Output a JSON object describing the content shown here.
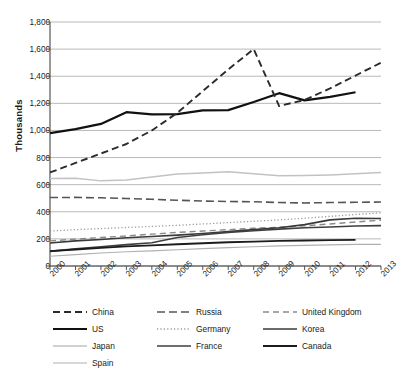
{
  "chart_data": {
    "type": "line",
    "title": "",
    "xlabel": "",
    "ylabel": "Thousands",
    "x": [
      2000,
      2001,
      2002,
      2003,
      2004,
      2005,
      2006,
      2007,
      2008,
      2009,
      2010,
      2011,
      2012,
      2013
    ],
    "categories": [
      "2000",
      "2001",
      "2002",
      "2003",
      "2004",
      "2005",
      "2006",
      "2007",
      "2008",
      "2009",
      "2010",
      "2011",
      "2012",
      "2013"
    ],
    "ylim": [
      0,
      1800
    ],
    "ytick_values": [
      0,
      200,
      400,
      600,
      800,
      1000,
      1200,
      1400,
      1600,
      1800
    ],
    "ytick_labels": [
      "0",
      "200",
      "400",
      "600",
      "800",
      "1,000",
      "1,200",
      "1,400",
      "1,600",
      "1,800"
    ],
    "grid": true,
    "legend_position": "bottom",
    "series": [
      {
        "name": "China",
        "color": "#2b2b2b",
        "width": 1.9,
        "dash": "7,4",
        "values": [
          690,
          760,
          830,
          900,
          1000,
          1130,
          1290,
          1450,
          1600,
          1180,
          1225,
          1310,
          1405,
          1500
        ]
      },
      {
        "name": "Russia",
        "color": "#555555",
        "width": 1.6,
        "dash": "8,4",
        "values": [
          505,
          506,
          503,
          498,
          492,
          485,
          479,
          476,
          474,
          468,
          465,
          468,
          470,
          472
        ]
      },
      {
        "name": "United Kingdom",
        "color": "#8a8a8a",
        "width": 1.4,
        "dash": "6,4",
        "values": [
          185,
          198,
          210,
          222,
          235,
          248,
          258,
          268,
          278,
          286,
          296,
          310,
          325,
          338
        ]
      },
      {
        "name": "US",
        "color": "#111111",
        "width": 2.2,
        "dash": "none",
        "values": [
          980,
          1010,
          1048,
          1135,
          1118,
          1120,
          1148,
          1150,
          1210,
          1275,
          1222,
          1248,
          1282,
          null
        ]
      },
      {
        "name": "Germany",
        "color": "#9a9a9a",
        "width": 1.3,
        "dash": "1.2,2.2",
        "values": [
          258,
          268,
          276,
          284,
          292,
          300,
          310,
          320,
          330,
          340,
          352,
          366,
          380,
          392
        ]
      },
      {
        "name": "Korea",
        "color": "#3a3a3a",
        "width": 1.6,
        "dash": "none",
        "values": [
          170,
          185,
          196,
          208,
          218,
          228,
          240,
          254,
          268,
          282,
          305,
          340,
          352,
          350
        ]
      },
      {
        "name": "Japan",
        "color": "#c2c2c2",
        "width": 1.5,
        "dash": "none",
        "values": [
          645,
          648,
          628,
          634,
          656,
          678,
          686,
          695,
          680,
          665,
          668,
          672,
          680,
          690
        ]
      },
      {
        "name": "France",
        "color": "#3f3f3f",
        "width": 1.6,
        "dash": "none",
        "values": [
          108,
          126,
          142,
          158,
          172,
          210,
          230,
          248,
          260,
          272,
          282,
          288,
          295,
          298
        ]
      },
      {
        "name": "Canada",
        "color": "#1c1c1c",
        "width": 1.9,
        "dash": "none",
        "values": [
          110,
          122,
          134,
          145,
          152,
          160,
          168,
          175,
          180,
          185,
          188,
          191,
          193,
          null
        ]
      },
      {
        "name": "Spain",
        "color": "#b0b0b0",
        "width": 1.2,
        "dash": "none",
        "values": [
          72,
          84,
          96,
          105,
          112,
          120,
          128,
          136,
          142,
          148,
          152,
          156,
          159,
          160
        ]
      }
    ]
  },
  "legend": {
    "entries": [
      {
        "label": "China"
      },
      {
        "label": "Russia"
      },
      {
        "label": "United Kingdom"
      },
      {
        "label": "US"
      },
      {
        "label": "Germany"
      },
      {
        "label": "Korea"
      },
      {
        "label": "Japan"
      },
      {
        "label": "France"
      },
      {
        "label": "Canada"
      },
      {
        "label": "Spain"
      }
    ]
  }
}
